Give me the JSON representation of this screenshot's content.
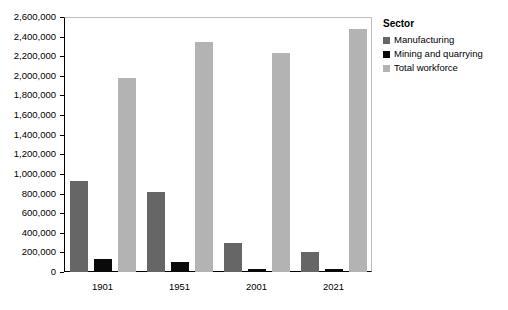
{
  "chart_data": {
    "type": "bar",
    "title": "",
    "subtitle": "",
    "xlabel": "",
    "ylabel": "",
    "categories": [
      "1901",
      "1951",
      "2001",
      "2021"
    ],
    "series": [
      {
        "name": "Manufacturing",
        "color": "#666666",
        "values": [
          928000,
          820000,
          300000,
          205000
        ]
      },
      {
        "name": "Mining and quarrying",
        "color": "#0a0a0a",
        "values": [
          135000,
          105000,
          30000,
          35000
        ]
      },
      {
        "name": "Total workforce",
        "color": "#b3b3b3",
        "values": [
          1980000,
          2350000,
          2230000,
          2480000
        ]
      }
    ],
    "ylim": [
      0,
      2600000
    ],
    "ytick_step": 200000,
    "ytick_labels": [
      "0",
      "200,000",
      "400,000",
      "600,000",
      "800,000",
      "1,000,000",
      "1,200,000",
      "1,400,000",
      "1,600,000",
      "1,800,000",
      "2,000,000",
      "2,200,000",
      "2,400,000",
      "2,600,000"
    ],
    "grid": false,
    "legend_position": "right",
    "legend_title": "Sector"
  },
  "legend": {
    "title": "Sector",
    "items": [
      {
        "label": "Manufacturing",
        "color": "#666666"
      },
      {
        "label": "Mining and quarrying",
        "color": "#0a0a0a"
      },
      {
        "label": "Total workforce",
        "color": "#b3b3b3"
      }
    ]
  }
}
